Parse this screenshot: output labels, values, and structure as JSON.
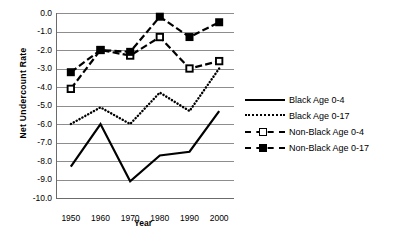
{
  "chart_data": {
    "type": "line",
    "title": "",
    "xlabel": "Year",
    "ylabel": "Net  Undercount Rate",
    "x": [
      1950,
      1960,
      1970,
      1980,
      1990,
      2000
    ],
    "xlim": [
      1945,
      2005
    ],
    "ylim": [
      -10.0,
      0.0
    ],
    "yticks": [
      "0.0",
      "-1.0",
      "-2.0",
      "-3.0",
      "-4.0",
      "-5.0",
      "-6.0",
      "-7.0",
      "-8.0",
      "-9.0",
      "-10.0"
    ],
    "ytick_values": [
      0.0,
      -1.0,
      -2.0,
      -3.0,
      -4.0,
      -5.0,
      -6.0,
      -7.0,
      -8.0,
      -9.0,
      -10.0
    ],
    "xticks": [
      "1950",
      "1960",
      "1970",
      "1980",
      "1990",
      "2000"
    ],
    "grid": true,
    "legend_position": "right",
    "series": [
      {
        "name": "Black Age 0-4",
        "style": "solid",
        "marker": "none",
        "values": [
          -8.3,
          -6.0,
          -9.1,
          -7.7,
          -7.5,
          -5.3
        ]
      },
      {
        "name": "Black Age 0-17",
        "style": "dotted",
        "marker": "none",
        "values": [
          -6.0,
          -5.1,
          -6.0,
          -4.3,
          -5.3,
          -3.0
        ]
      },
      {
        "name": "Non-Black Age 0-4",
        "style": "dashed",
        "marker": "open-square",
        "values": [
          -4.1,
          -2.0,
          -2.3,
          -1.3,
          -3.0,
          -2.6
        ]
      },
      {
        "name": "Non-Black Age 0-17",
        "style": "dashed",
        "marker": "filled-square",
        "values": [
          -3.2,
          -2.0,
          -2.1,
          -0.2,
          -1.3,
          -0.5
        ]
      }
    ]
  },
  "legend": {
    "items": [
      {
        "label": "Black Age 0-4",
        "key": "solid-line-key"
      },
      {
        "label": "Black Age 0-17",
        "key": "dotted-line-key"
      },
      {
        "label": "Non-Black Age 0-4",
        "key": "dashed-open-square-key"
      },
      {
        "label": "Non-Black Age 0-17",
        "key": "dashed-filled-square-key"
      }
    ]
  }
}
